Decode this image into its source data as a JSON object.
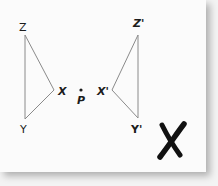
{
  "figure": {
    "type": "reflection-diagram",
    "center_point": {
      "label": "P"
    },
    "original_triangle": {
      "vertices": [
        {
          "label": "Z"
        },
        {
          "label": "X"
        },
        {
          "label": "Y"
        }
      ]
    },
    "image_triangle": {
      "vertices": [
        {
          "label": "Z'"
        },
        {
          "label": "X'"
        },
        {
          "label": "Y'"
        }
      ]
    },
    "mark": {
      "symbol": "X",
      "meaning": "incorrect"
    },
    "colors": {
      "line": "#8a8a8a",
      "text": "#1c1c1c",
      "paper": "#fbfbfb",
      "background": "#f3f3f3"
    }
  }
}
